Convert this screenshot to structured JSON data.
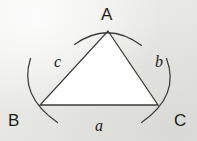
{
  "figure": {
    "kind": "triangle-angle-diagram",
    "background_color": "#e9e9e7",
    "interior_fill": "#ffffff",
    "stroke_color": "#3c3c3c",
    "label_color": "#1e1e1e",
    "vertices": {
      "A": {
        "label": "A",
        "x": 108,
        "y": 31
      },
      "B": {
        "label": "B",
        "x": 40,
        "y": 105
      },
      "C": {
        "label": "C",
        "x": 158,
        "y": 105
      }
    },
    "sides": {
      "a": {
        "label": "a",
        "opposite_vertex": "A",
        "between": "B-C"
      },
      "b": {
        "label": "b",
        "opposite_vertex": "B",
        "between": "A-C"
      },
      "c": {
        "label": "c",
        "opposite_vertex": "C",
        "between": "A-B"
      }
    },
    "angle_arcs": [
      {
        "at_vertex": "A",
        "name": "angle-arc-a"
      },
      {
        "at_vertex": "B",
        "name": "angle-arc-b"
      },
      {
        "at_vertex": "C",
        "name": "angle-arc-c"
      }
    ]
  }
}
